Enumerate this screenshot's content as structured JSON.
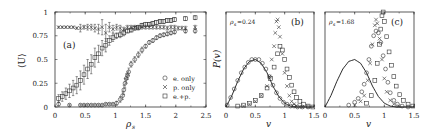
{
  "chart_data": [
    {
      "panel": "(a)",
      "type": "scatter",
      "title": "",
      "xlabel": "ρs",
      "ylabel": "⟨U⟩",
      "xlim": [
        0,
        2.5
      ],
      "ylim": [
        0,
        1
      ],
      "xticks": [
        "0",
        "0.5",
        "1",
        "1.5",
        "2",
        "2.5"
      ],
      "yticks": [
        "0",
        "0.25",
        "0.5",
        "0.75",
        "1"
      ],
      "grid": false,
      "legend_position": "lower right",
      "legend": [
        "e. only",
        "p. only",
        "e.+p."
      ],
      "series": [
        {
          "name": "e. only",
          "marker": "circle",
          "x": [
            0.06,
            0.24,
            0.42,
            0.48,
            0.54,
            0.6,
            0.66,
            0.72,
            0.78,
            0.84,
            0.9,
            0.96,
            1.02,
            1.08,
            1.12,
            1.14,
            1.16,
            1.18,
            1.2,
            1.22,
            1.26,
            1.32,
            1.38,
            1.44,
            1.5,
            1.56,
            1.62,
            1.68,
            1.74,
            1.8,
            1.86,
            1.92,
            1.98,
            2.16,
            2.32
          ],
          "y": [
            0.03,
            0.02,
            0.02,
            0.02,
            0.02,
            0.02,
            0.02,
            0.02,
            0.02,
            0.03,
            0.03,
            0.03,
            0.04,
            0.08,
            0.12,
            0.18,
            0.25,
            0.3,
            0.33,
            0.37,
            0.45,
            0.5,
            0.55,
            0.6,
            0.64,
            0.68,
            0.7,
            0.73,
            0.75,
            0.76,
            0.77,
            0.78,
            0.79,
            0.8,
            0.8
          ],
          "yerr": [
            0.02,
            0.01,
            0.01,
            0.01,
            0.01,
            0.01,
            0.01,
            0.01,
            0.01,
            0.01,
            0.01,
            0.01,
            0.02,
            0.03,
            0.04,
            0.05,
            0.05,
            0.05,
            0.04,
            0.04,
            0.03,
            0.03,
            0.03,
            0.03,
            0.02,
            0.02,
            0.02,
            0.02,
            0.02,
            0.02,
            0.02,
            0.02,
            0.02,
            0.02,
            0.02
          ]
        },
        {
          "name": "p. only",
          "marker": "x",
          "x": [
            0.06,
            0.12,
            0.18,
            0.24,
            0.3,
            0.36,
            0.42,
            0.48,
            0.54,
            0.6,
            0.66,
            0.72,
            0.78,
            0.84,
            0.9,
            0.96,
            1.02,
            1.08,
            1.14,
            1.2,
            1.26,
            1.32,
            1.38,
            1.44,
            1.5,
            1.56,
            1.62,
            1.68,
            1.74,
            1.8,
            1.86,
            1.92,
            1.98,
            2.04,
            2.1,
            2.16,
            2.32
          ],
          "y": [
            0.84,
            0.84,
            0.84,
            0.84,
            0.84,
            0.83,
            0.83,
            0.84,
            0.84,
            0.84,
            0.83,
            0.82,
            0.84,
            0.78,
            0.84,
            0.82,
            0.84,
            0.83,
            0.82,
            0.84,
            0.84,
            0.84,
            0.83,
            0.84,
            0.84,
            0.84,
            0.84,
            0.84,
            0.84,
            0.84,
            0.83,
            0.84,
            0.84,
            0.83,
            0.83,
            0.83,
            0.84
          ],
          "yerr": [
            0.01,
            0.01,
            0.01,
            0.01,
            0.01,
            0.01,
            0.04,
            0.02,
            0.03,
            0.03,
            0.04,
            0.05,
            0.08,
            0.09,
            0.05,
            0.04,
            0.03,
            0.03,
            0.02,
            0.02,
            0.02,
            0.02,
            0.02,
            0.02,
            0.02,
            0.02,
            0.02,
            0.02,
            0.02,
            0.02,
            0.02,
            0.02,
            0.02,
            0.02,
            0.02,
            0.02,
            0.02
          ]
        },
        {
          "name": "e.+p.",
          "marker": "square",
          "x": [
            0.06,
            0.12,
            0.18,
            0.24,
            0.3,
            0.36,
            0.42,
            0.48,
            0.54,
            0.6,
            0.66,
            0.72,
            0.78,
            0.84,
            0.9,
            0.96,
            1.02,
            1.08,
            1.14,
            1.2,
            1.26,
            1.32,
            1.38,
            1.44,
            1.5,
            1.56,
            1.62,
            1.68,
            1.74,
            1.8,
            1.86,
            1.92,
            1.98,
            2.16,
            2.32
          ],
          "y": [
            0.09,
            0.11,
            0.14,
            0.17,
            0.2,
            0.23,
            0.28,
            0.34,
            0.4,
            0.45,
            0.52,
            0.56,
            0.62,
            0.65,
            0.7,
            0.73,
            0.75,
            0.76,
            0.78,
            0.8,
            0.81,
            0.83,
            0.84,
            0.86,
            0.87,
            0.87,
            0.88,
            0.89,
            0.9,
            0.9,
            0.91,
            0.91,
            0.92,
            0.93,
            0.94
          ],
          "yerr": [
            0.04,
            0.05,
            0.06,
            0.07,
            0.08,
            0.09,
            0.1,
            0.1,
            0.1,
            0.1,
            0.1,
            0.09,
            0.08,
            0.07,
            0.05,
            0.04,
            0.03,
            0.03,
            0.03,
            0.02,
            0.02,
            0.02,
            0.02,
            0.02,
            0.02,
            0.02,
            0.02,
            0.02,
            0.02,
            0.02,
            0.02,
            0.02,
            0.02,
            0.02,
            0.02
          ]
        }
      ]
    },
    {
      "panel": "(b)",
      "type": "scatter",
      "annotation": "ρs=0.24",
      "xlabel": "v",
      "ylabel": "P(v)",
      "xlim": [
        0,
        1.5
      ],
      "ylim": [
        0,
        1
      ],
      "xticks": [
        "0",
        "0.5",
        "1",
        "1.5"
      ],
      "yticks": [],
      "grid": false,
      "series": [
        {
          "name": "reference curve",
          "marker": "line",
          "x": [
            0,
            0.1,
            0.2,
            0.3,
            0.4,
            0.5,
            0.6,
            0.7,
            0.8,
            0.9,
            1.0,
            1.1,
            1.2,
            1.3,
            1.4,
            1.5
          ],
          "y": [
            0.0,
            0.12,
            0.27,
            0.4,
            0.48,
            0.5,
            0.46,
            0.36,
            0.22,
            0.11,
            0.04,
            0.01,
            0.0,
            0.0,
            0.0,
            0.0
          ]
        },
        {
          "name": "e. only",
          "marker": "circle",
          "x": [
            0.02,
            0.08,
            0.14,
            0.2,
            0.26,
            0.32,
            0.38,
            0.44,
            0.5,
            0.56,
            0.62,
            0.68,
            0.74,
            0.8,
            0.86,
            0.92,
            0.98,
            1.04,
            1.1,
            1.16,
            1.22,
            1.3,
            1.4
          ],
          "y": [
            0.02,
            0.1,
            0.19,
            0.28,
            0.36,
            0.42,
            0.47,
            0.5,
            0.5,
            0.5,
            0.46,
            0.4,
            0.32,
            0.23,
            0.15,
            0.09,
            0.05,
            0.03,
            0.01,
            0.01,
            0.0,
            0.0,
            0.0
          ]
        },
        {
          "name": "p. only",
          "marker": "x",
          "x": [
            0.3,
            0.4,
            0.5,
            0.6,
            0.7,
            0.74,
            0.78,
            0.82,
            0.84,
            0.86,
            0.88,
            0.9,
            0.92,
            0.96,
            1.0,
            1.04,
            1.08,
            1.12,
            1.16,
            1.2,
            1.3
          ],
          "y": [
            0.01,
            0.03,
            0.06,
            0.12,
            0.22,
            0.32,
            0.5,
            0.64,
            0.78,
            0.9,
            0.92,
            0.84,
            0.74,
            0.56,
            0.36,
            0.22,
            0.12,
            0.06,
            0.03,
            0.01,
            0.0
          ]
        },
        {
          "name": "e.+p.",
          "marker": "square",
          "x": [
            0.2,
            0.3,
            0.4,
            0.5,
            0.6,
            0.7,
            0.76,
            0.82,
            0.88,
            0.92,
            0.96,
            1.0,
            1.04,
            1.08,
            1.12,
            1.16,
            1.2,
            1.26,
            1.32,
            1.4,
            1.48
          ],
          "y": [
            0.01,
            0.02,
            0.04,
            0.07,
            0.12,
            0.2,
            0.3,
            0.42,
            0.56,
            0.64,
            0.6,
            0.5,
            0.4,
            0.31,
            0.23,
            0.16,
            0.1,
            0.06,
            0.03,
            0.01,
            0.0
          ]
        }
      ]
    },
    {
      "panel": "(c)",
      "type": "scatter",
      "annotation": "ρs=1.68",
      "xlabel": "v",
      "ylabel": "",
      "xlim": [
        0,
        1.5
      ],
      "ylim": [
        0,
        1
      ],
      "xticks": [
        "0",
        "0.5",
        "1",
        "1.5"
      ],
      "yticks": [],
      "grid": false,
      "series": [
        {
          "name": "reference curve",
          "marker": "line",
          "x": [
            0,
            0.1,
            0.2,
            0.3,
            0.4,
            0.5,
            0.6,
            0.7,
            0.8,
            0.9,
            1.0,
            1.1,
            1.2,
            1.3,
            1.4,
            1.5
          ],
          "y": [
            0.0,
            0.12,
            0.27,
            0.4,
            0.48,
            0.5,
            0.46,
            0.36,
            0.22,
            0.11,
            0.04,
            0.01,
            0.0,
            0.0,
            0.0,
            0.0
          ]
        },
        {
          "name": "e. only",
          "marker": "circle",
          "x": [
            0.4,
            0.5,
            0.56,
            0.62,
            0.66,
            0.7,
            0.74,
            0.78,
            0.82,
            0.86,
            0.9,
            0.94,
            0.98,
            1.02,
            1.06,
            1.1,
            1.16,
            1.22,
            1.3,
            1.4
          ],
          "y": [
            0.02,
            0.05,
            0.09,
            0.16,
            0.24,
            0.36,
            0.5,
            0.64,
            0.75,
            0.8,
            0.78,
            0.68,
            0.54,
            0.4,
            0.26,
            0.15,
            0.07,
            0.03,
            0.01,
            0.0
          ]
        },
        {
          "name": "p. only",
          "marker": "x",
          "x": [
            0.5,
            0.6,
            0.66,
            0.72,
            0.76,
            0.8,
            0.84,
            0.86,
            0.88,
            0.92,
            0.96,
            1.0,
            1.04,
            1.1,
            1.16,
            1.24
          ],
          "y": [
            0.02,
            0.06,
            0.12,
            0.28,
            0.46,
            0.66,
            0.86,
            0.92,
            0.88,
            0.72,
            0.5,
            0.3,
            0.16,
            0.07,
            0.03,
            0.01
          ],
          "note": "overlaps circles near peak"
        },
        {
          "name": "e.+p.",
          "marker": "square",
          "x": [
            0.7,
            0.78,
            0.84,
            0.88,
            0.92,
            0.94,
            0.96,
            0.98,
            1.0,
            1.04,
            1.08,
            1.12,
            1.16,
            1.2,
            1.26,
            1.32,
            1.4,
            1.48
          ],
          "y": [
            0.04,
            0.12,
            0.28,
            0.46,
            0.66,
            0.82,
            0.96,
            1.0,
            0.9,
            0.74,
            0.58,
            0.44,
            0.32,
            0.22,
            0.13,
            0.07,
            0.03,
            0.01
          ]
        }
      ]
    }
  ],
  "figure": {
    "panel_a": {
      "label": "(a)",
      "xlabel": "ρ",
      "xlabel_sub": "s",
      "ylabel": "⟨U⟩"
    },
    "panel_b": {
      "label": "(b)",
      "xlabel": "v",
      "ylabel": "P(v)",
      "annotation_rho": "ρ",
      "annotation_sub": "s",
      "annotation_value": "=0.24"
    },
    "panel_c": {
      "label": "(c)",
      "xlabel": "v",
      "annotation_rho": "ρ",
      "annotation_sub": "s",
      "annotation_value": "=1.68"
    },
    "legend": [
      {
        "symbol": "○",
        "label": "e. only"
      },
      {
        "symbol": "×",
        "label": "p. only"
      },
      {
        "symbol": "□",
        "label": "e.+p."
      }
    ]
  }
}
